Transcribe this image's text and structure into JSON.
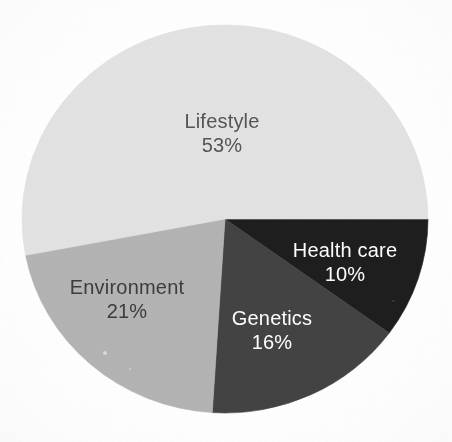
{
  "figure": {
    "background_color": "#ffffff",
    "geometry": {
      "center_x": 225,
      "center_y": 219,
      "radius_x": 203,
      "radius_y": 194,
      "start_angle_deg": 0,
      "direction": "clockwise"
    }
  },
  "chart_data": {
    "type": "pie",
    "title": "",
    "subtitle": "",
    "xlabel": "",
    "ylabel": "",
    "legend_position": "none",
    "grid": false,
    "units": "percent",
    "total": 100,
    "start_angle_deg": 0,
    "direction": "clockwise",
    "categories": [
      "Health care",
      "Genetics",
      "Environment",
      "Lifestyle"
    ],
    "values": [
      10,
      16,
      21,
      53
    ],
    "value_labels": [
      "10%",
      "16%",
      "21%",
      "53%"
    ],
    "colors": [
      "#1e1e1e",
      "#434343",
      "#b4b4b4",
      "#e3e3e3"
    ],
    "label_colors": [
      "#ffffff",
      "#ffffff",
      "#3c3c3c",
      "#555555"
    ],
    "slices": [
      {
        "name": "Health care",
        "value": 10,
        "value_label": "10%",
        "color": "#1e1e1e",
        "label_color": "#ffffff",
        "start_angle_deg": 0,
        "end_angle_deg": 36,
        "label_x": 345,
        "label_y": 257,
        "value_x": 345,
        "value_y": 281
      },
      {
        "name": "Genetics",
        "value": 16,
        "value_label": "16%",
        "color": "#434343",
        "label_color": "#ffffff",
        "start_angle_deg": 36,
        "end_angle_deg": 93.6,
        "label_x": 272,
        "label_y": 325,
        "value_x": 272,
        "value_y": 349
      },
      {
        "name": "Environment",
        "value": 21,
        "value_label": "21%",
        "color": "#b4b4b4",
        "label_color": "#3c3c3c",
        "start_angle_deg": 93.6,
        "end_angle_deg": 169.2,
        "label_x": 127,
        "label_y": 294,
        "value_x": 127,
        "value_y": 318
      },
      {
        "name": "Lifestyle",
        "value": 53,
        "value_label": "53%",
        "color": "#e3e3e3",
        "label_color": "#555555",
        "start_angle_deg": 169.2,
        "end_angle_deg": 360,
        "label_x": 222,
        "label_y": 128,
        "value_x": 222,
        "value_y": 152
      }
    ]
  }
}
